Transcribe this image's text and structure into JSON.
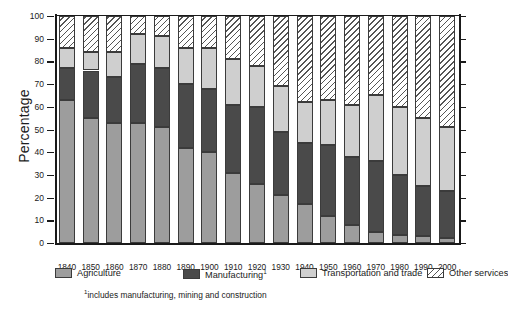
{
  "chart_data": {
    "type": "bar",
    "subtype": "stacked-100-percent",
    "title": "",
    "xlabel": "",
    "ylabel": "Percentage",
    "ylim": [
      0,
      100
    ],
    "ytick_step": 10,
    "yticks": [
      0,
      10,
      20,
      30,
      40,
      50,
      60,
      70,
      80,
      90,
      100
    ],
    "grid": false,
    "legend_position": "bottom",
    "categories": [
      "1840",
      "1850",
      "1860",
      "1870",
      "1880",
      "1890",
      "1900",
      "1910",
      "1920",
      "1930",
      "1940",
      "1950",
      "1960",
      "1970",
      "1980",
      "1990",
      "2000"
    ],
    "series": [
      {
        "name": "Agriculture",
        "key": "agri",
        "color": "#9d9d9d",
        "values": [
          63,
          55,
          53,
          53,
          51,
          42,
          40,
          31,
          26,
          21,
          17,
          12,
          8,
          5,
          3.5,
          3,
          2
        ]
      },
      {
        "name": "Manufacturing",
        "key": "mfg",
        "color": "#4a4a4a",
        "values": [
          14,
          21,
          20,
          26,
          26,
          28,
          28,
          30,
          34,
          28,
          27,
          31,
          30,
          31,
          26.5,
          22,
          21
        ]
      },
      {
        "name": "Transportation and trade",
        "key": "trans",
        "color": "#cfcfcf",
        "values": [
          9,
          8,
          11,
          13,
          14,
          16,
          18,
          20,
          18,
          20,
          18,
          20,
          23,
          29,
          30,
          30,
          28
        ]
      },
      {
        "name": "Other services",
        "key": "other",
        "color": "hatch-diagonal",
        "values": [
          14,
          16,
          16,
          8,
          9,
          14,
          14,
          19,
          22,
          31,
          38,
          37,
          39,
          35,
          40,
          45,
          49
        ]
      }
    ],
    "cumulative_tops": {
      "agri": [
        63,
        55,
        53,
        53,
        51,
        42,
        40,
        31,
        26,
        21,
        17,
        12,
        8,
        5,
        3.5,
        3,
        2
      ],
      "mfg": [
        77,
        76,
        73,
        79,
        77,
        70,
        68,
        61,
        60,
        49,
        44,
        43,
        38,
        36,
        30,
        25,
        23
      ],
      "trans": [
        86,
        84,
        84,
        92,
        91,
        86,
        86,
        81,
        78,
        69,
        62,
        63,
        61,
        65,
        60,
        55,
        51
      ],
      "other": [
        100,
        100,
        100,
        100,
        100,
        100,
        100,
        100,
        100,
        100,
        100,
        100,
        100,
        100,
        100,
        100,
        100
      ]
    }
  },
  "axis": {
    "y_title": "Percentage",
    "y_tick_labels": [
      "0",
      "10",
      "20",
      "30",
      "40",
      "50",
      "60",
      "70",
      "80",
      "90",
      "100"
    ],
    "x_tick_labels": [
      "1840",
      "1850",
      "1860",
      "1870",
      "1880",
      "1890",
      "1900",
      "1910",
      "1920",
      "1930",
      "1940",
      "1950",
      "1960",
      "1970",
      "1980",
      "1990",
      "2000"
    ]
  },
  "legend": {
    "items": [
      {
        "label": "Agriculture",
        "sup": "",
        "key": "agri"
      },
      {
        "label": "Manufacturing",
        "sup": "1",
        "key": "mfg"
      },
      {
        "label": "Transportation and trade",
        "sup": "",
        "key": "trans"
      },
      {
        "label": "Other services",
        "sup": "",
        "key": "other"
      }
    ]
  },
  "footnote": {
    "marker": "1",
    "text": "includes manufacturing, mining and construction"
  }
}
